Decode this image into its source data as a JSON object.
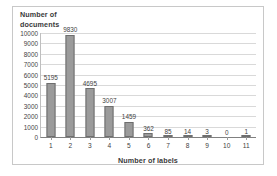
{
  "chart_data": {
    "type": "bar",
    "title": "",
    "categories": [
      "1",
      "2",
      "3",
      "4",
      "5",
      "6",
      "7",
      "8",
      "9",
      "10",
      "11"
    ],
    "values": [
      5195,
      9830,
      4695,
      3007,
      1459,
      362,
      85,
      14,
      3,
      0,
      1
    ],
    "data_labels": [
      "5195",
      "9830",
      "4695",
      "3007",
      "1459",
      "362",
      "85",
      "14",
      "3",
      "0",
      "1"
    ],
    "xlabel": "Number of labels",
    "ylabel": "Number of documents",
    "ylabel_line1": "Number of",
    "ylabel_line2": "documents",
    "ylim": [
      0,
      10000
    ],
    "ytick_labels": [
      "10000",
      "9000",
      "8000",
      "7000",
      "6000",
      "5000",
      "4000",
      "3000",
      "2000",
      "1000",
      "0"
    ],
    "ytick_values": [
      10000,
      9000,
      8000,
      7000,
      6000,
      5000,
      4000,
      3000,
      2000,
      1000,
      0
    ],
    "grid": true,
    "legend": false,
    "bar_color": "#9b9b9b",
    "bar_border_color": "#6e6e6e",
    "gridline_color": "#d9d9d9",
    "axis_color": "#808080",
    "text_color": "#3f3f3f",
    "frame_color": "#c8c8c8",
    "background": "#ffffff"
  }
}
